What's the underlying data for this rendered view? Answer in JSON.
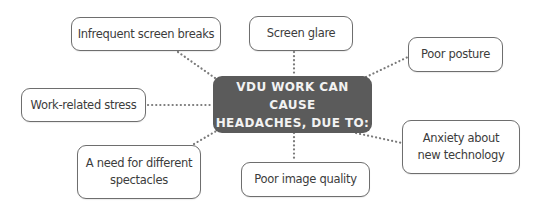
{
  "diagram": {
    "center": {
      "line1": "VDU WORK CAN CAUSE",
      "line2": "HEADACHES, DUE TO:"
    },
    "nodes": [
      {
        "id": "infrequent-breaks",
        "line1": "Infrequent screen breaks",
        "line2": ""
      },
      {
        "id": "screen-glare",
        "line1": "Screen glare",
        "line2": ""
      },
      {
        "id": "poor-posture",
        "line1": "Poor posture",
        "line2": ""
      },
      {
        "id": "work-stress",
        "line1": "Work-related stress",
        "line2": ""
      },
      {
        "id": "spectacles",
        "line1": "A need for different",
        "line2": "spectacles"
      },
      {
        "id": "image-quality",
        "line1": "Poor image quality",
        "line2": ""
      },
      {
        "id": "anxiety",
        "line1": "Anxiety about",
        "line2": "new technology"
      }
    ],
    "colors": {
      "center_bg": "#5b5b5b",
      "node_border": "#6e6e6e",
      "connector": "#7a7a7a"
    }
  }
}
